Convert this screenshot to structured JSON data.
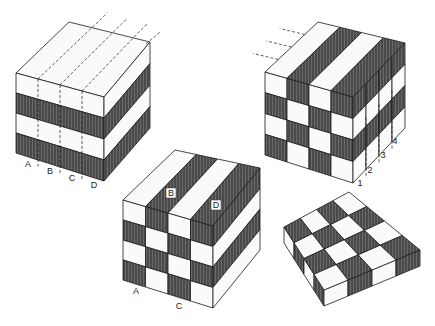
{
  "colors": {
    "light": "#fafafa",
    "dark": "#5a5a5a",
    "stroke": "#1a1a1a",
    "hatch": "#2a2a2a"
  },
  "cube1": {
    "description": "Cube with horizontal bands on front and right faces, dashed slicing lines",
    "front_bands": [
      "light",
      "dark",
      "light",
      "dark"
    ],
    "slice_labels": [
      "A",
      "B",
      "C",
      "D"
    ]
  },
  "cube2": {
    "description": "Cube with checkered front, striped top, dashed lines on right face",
    "front_grid": [
      [
        "light",
        "dark",
        "light",
        "dark"
      ],
      [
        "dark",
        "light",
        "dark",
        "light"
      ],
      [
        "light",
        "dark",
        "light",
        "dark"
      ],
      [
        "dark",
        "light",
        "dark",
        "light"
      ]
    ],
    "top_columns": [
      "light",
      "dark",
      "light",
      "dark"
    ],
    "right_rows": [
      "dark",
      "light",
      "dark",
      "light"
    ],
    "slice_labels": [
      "1",
      "2",
      "3",
      "4"
    ]
  },
  "cube3": {
    "description": "Cube with striped top and checkered front",
    "front_grid": [
      [
        "light",
        "dark",
        "light",
        "dark"
      ],
      [
        "dark",
        "light",
        "dark",
        "light"
      ],
      [
        "light",
        "dark",
        "light",
        "dark"
      ],
      [
        "dark",
        "light",
        "dark",
        "light"
      ]
    ],
    "top_columns": [
      "light",
      "dark",
      "light",
      "dark"
    ],
    "right_rows": [
      "dark",
      "light",
      "dark",
      "light"
    ],
    "top_labels": [
      "B",
      "D"
    ],
    "bottom_labels": [
      "A",
      "C"
    ]
  },
  "slab": {
    "description": "Flat slab with 4x4 checkerboard top",
    "top_grid": [
      [
        "light",
        "dark",
        "light",
        "dark"
      ],
      [
        "dark",
        "light",
        "dark",
        "light"
      ],
      [
        "light",
        "dark",
        "light",
        "dark"
      ],
      [
        "dark",
        "light",
        "dark",
        "light"
      ]
    ]
  }
}
